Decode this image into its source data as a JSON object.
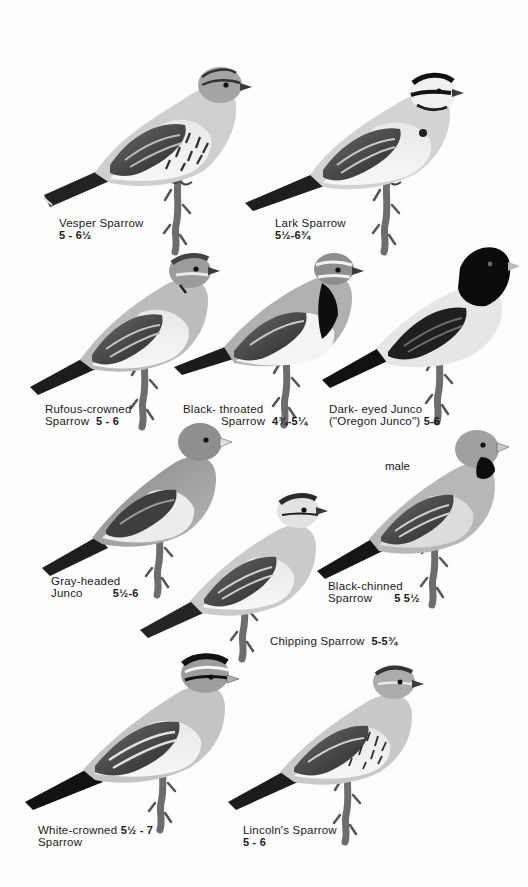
{
  "plate": {
    "background": "#ffffff",
    "ink": "#1a1a1a",
    "species": [
      {
        "id": "vesper",
        "name_lines": [
          "Vesper Sparrow"
        ],
        "size": "5 - 6½",
        "size_line": 2
      },
      {
        "id": "lark",
        "name_lines": [
          "Lark Sparrow"
        ],
        "size": "5½-6¾",
        "size_line": 2
      },
      {
        "id": "rufous_crowned",
        "name_lines": [
          "Rufous-crowned",
          "Sparrow"
        ],
        "size": "5 - 6",
        "size_line": 2
      },
      {
        "id": "black_throated",
        "name_lines": [
          "Black- throated",
          "Sparrow"
        ],
        "size": "4¾-5¼",
        "size_line": 2
      },
      {
        "id": "dark_eyed_junco",
        "name_lines": [
          "Dark- eyed Junco",
          "(\"Oregon Junco\")"
        ],
        "size": "5-6",
        "size_line": 2
      },
      {
        "id": "gray_headed_junco",
        "name_lines": [
          "Gray-headed",
          "Junco"
        ],
        "size": "5½-6",
        "size_line": 2
      },
      {
        "id": "black_chinned",
        "name_lines": [
          "Black-chinned",
          "Sparrow"
        ],
        "size": "5 5½",
        "size_line": 2,
        "annotation": "male"
      },
      {
        "id": "chipping",
        "name_lines": [
          "Chipping Sparrow"
        ],
        "size": "5-5¾",
        "size_line": 1
      },
      {
        "id": "white_crowned",
        "name_lines": [
          "White-crowned",
          "Sparrow"
        ],
        "size": "5½ - 7",
        "size_line": 1
      },
      {
        "id": "lincolns",
        "name_lines": [
          "Lincoln's Sparrow"
        ],
        "size": "5 - 6",
        "size_line": 2
      }
    ]
  },
  "captions": {
    "vesper": {
      "l1": "Vesper Sparrow",
      "size": "5 - 6½"
    },
    "lark": {
      "l1": "Lark Sparrow",
      "size": "5½-6¾"
    },
    "rufous": {
      "l1": "Rufous-crowned",
      "l2": "Sparrow",
      "size": "5 - 6"
    },
    "black_throated": {
      "l1": "Black- throated",
      "l2": "Sparrow",
      "size": "4¾-5¼"
    },
    "junco": {
      "l1": "Dark- eyed Junco",
      "l2": "(\"Oregon Junco\")",
      "size": "5-6"
    },
    "gray_headed": {
      "l1": "Gray-headed",
      "l2": "Junco",
      "size": "5½-6"
    },
    "black_chinned": {
      "l1": "Black-chinned",
      "l2": "Sparrow",
      "size": "5  5½",
      "annotation": "male"
    },
    "chipping": {
      "l1": "Chipping Sparrow",
      "size": "5-5¾"
    },
    "white_crowned": {
      "l1": "White-crowned",
      "l2": "Sparrow",
      "size": "5½ - 7"
    },
    "lincolns": {
      "l1": "Lincoln's Sparrow",
      "size": "5 - 6"
    }
  }
}
